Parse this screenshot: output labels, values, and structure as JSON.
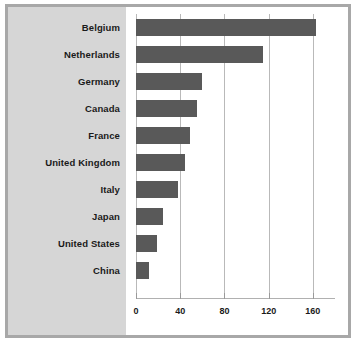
{
  "chart_data": {
    "type": "bar",
    "orientation": "horizontal",
    "title": "",
    "subtitle": "",
    "xlabel": "",
    "ylabel": "",
    "xlim": [
      0,
      180
    ],
    "xticks": [
      0,
      40,
      80,
      120,
      160
    ],
    "xtick_labels": [
      "0",
      "40",
      "80",
      "120",
      "160"
    ],
    "grid": true,
    "grid_axis": "x",
    "legend": false,
    "categories": [
      "Belgium",
      "Netherlands",
      "Germany",
      "Canada",
      "France",
      "United Kingdom",
      "Italy",
      "Japan",
      "United States",
      "China"
    ],
    "values": [
      163,
      115,
      60,
      55,
      49,
      44,
      38,
      24,
      19,
      12
    ],
    "bars": [
      {
        "label": "Belgium",
        "value": 163
      },
      {
        "label": "Netherlands",
        "value": 115
      },
      {
        "label": "Germany",
        "value": 60
      },
      {
        "label": "Canada",
        "value": 55
      },
      {
        "label": "France",
        "value": 49
      },
      {
        "label": "United Kingdom",
        "value": 44
      },
      {
        "label": "Italy",
        "value": 38
      },
      {
        "label": "Japan",
        "value": 24
      },
      {
        "label": "United States",
        "value": 19
      },
      {
        "label": "China",
        "value": 12
      }
    ],
    "colors": {
      "bar": "#595959",
      "label_panel_background": "#d6d6d6",
      "plot_background": "#ffffff",
      "gridline": "#b9b9b9",
      "frame_border": "#a8a8a8",
      "text": "#1a1a1a"
    }
  }
}
